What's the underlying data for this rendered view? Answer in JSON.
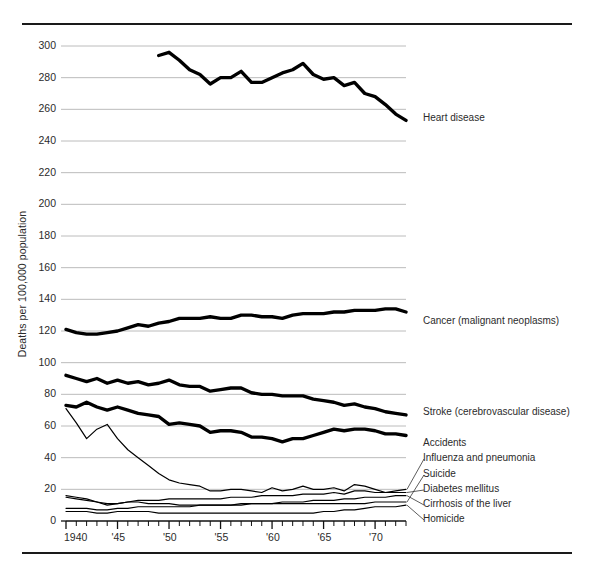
{
  "chart_data": {
    "type": "line",
    "title": "",
    "xlabel": "",
    "ylabel": "Deaths per 100,000 population",
    "xlim": [
      1940,
      1973
    ],
    "ylim": [
      0,
      300
    ],
    "grid": true,
    "legend_position": "right-inline",
    "y_ticks": [
      0,
      20,
      40,
      60,
      80,
      100,
      120,
      140,
      160,
      180,
      200,
      220,
      240,
      260,
      280,
      300
    ],
    "y_tick_labels": [
      "0",
      "20",
      "40",
      "60",
      "80",
      "100",
      "120",
      "140",
      "160",
      "180",
      "200",
      "220",
      "240",
      "260",
      "280",
      "300"
    ],
    "x_ticks": [
      1940,
      1945,
      1950,
      1955,
      1960,
      1965,
      1970
    ],
    "x_tick_labels": [
      "1940",
      "'45",
      "'50",
      "'55",
      "'60",
      "'65",
      "'70"
    ],
    "x_minor_step": 1,
    "series": [
      {
        "name": "Heart disease",
        "label": "Heart disease",
        "emphasis": "heavy",
        "x": [
          1949,
          1950,
          1951,
          1952,
          1953,
          1954,
          1955,
          1956,
          1957,
          1958,
          1959,
          1960,
          1961,
          1962,
          1963,
          1964,
          1965,
          1966,
          1967,
          1968,
          1969,
          1970,
          1971,
          1972,
          1973
        ],
        "values": [
          294,
          296,
          291,
          285,
          282,
          276,
          280,
          280,
          284,
          277,
          277,
          280,
          283,
          285,
          289,
          282,
          279,
          280,
          275,
          277,
          270,
          268,
          263,
          257,
          253
        ]
      },
      {
        "name": "Cancer (malignant neoplasms)",
        "label": "Cancer (malignant neoplasms)",
        "emphasis": "heavy",
        "x": [
          1940,
          1941,
          1942,
          1943,
          1944,
          1945,
          1946,
          1947,
          1948,
          1949,
          1950,
          1951,
          1952,
          1953,
          1954,
          1955,
          1956,
          1957,
          1958,
          1959,
          1960,
          1961,
          1962,
          1963,
          1964,
          1965,
          1966,
          1967,
          1968,
          1969,
          1970,
          1971,
          1972,
          1973
        ],
        "values": [
          121,
          119,
          118,
          118,
          119,
          120,
          122,
          124,
          123,
          125,
          126,
          128,
          128,
          128,
          129,
          128,
          128,
          130,
          130,
          129,
          129,
          128,
          130,
          131,
          131,
          131,
          132,
          132,
          133,
          133,
          133,
          134,
          134,
          132
        ]
      },
      {
        "name": "Stroke (cerebrovascular disease)",
        "label": "Stroke (cerebrovascular disease)",
        "emphasis": "heavy",
        "x": [
          1940,
          1941,
          1942,
          1943,
          1944,
          1945,
          1946,
          1947,
          1948,
          1949,
          1950,
          1951,
          1952,
          1953,
          1954,
          1955,
          1956,
          1957,
          1958,
          1959,
          1960,
          1961,
          1962,
          1963,
          1964,
          1965,
          1966,
          1967,
          1968,
          1969,
          1970,
          1971,
          1972,
          1973
        ],
        "values": [
          92,
          90,
          88,
          90,
          87,
          89,
          87,
          88,
          86,
          87,
          89,
          86,
          85,
          85,
          82,
          83,
          84,
          84,
          81,
          80,
          80,
          79,
          79,
          79,
          77,
          76,
          75,
          73,
          74,
          72,
          71,
          69,
          68,
          67
        ]
      },
      {
        "name": "Accidents",
        "label": "Accidents",
        "emphasis": "heavy",
        "x": [
          1940,
          1941,
          1942,
          1943,
          1944,
          1945,
          1946,
          1947,
          1948,
          1949,
          1950,
          1951,
          1952,
          1953,
          1954,
          1955,
          1956,
          1957,
          1958,
          1959,
          1960,
          1961,
          1962,
          1963,
          1964,
          1965,
          1966,
          1967,
          1968,
          1969,
          1970,
          1971,
          1972,
          1973
        ],
        "values": [
          73,
          72,
          75,
          72,
          70,
          72,
          70,
          68,
          67,
          66,
          61,
          62,
          61,
          60,
          56,
          57,
          57,
          56,
          53,
          53,
          52,
          50,
          52,
          52,
          54,
          56,
          58,
          57,
          58,
          58,
          57,
          55,
          55,
          54
        ]
      },
      {
        "name": "Influenza and pneumonia",
        "label": "Influenza and pneumonia",
        "emphasis": "light",
        "x": [
          1940,
          1941,
          1942,
          1943,
          1944,
          1945,
          1946,
          1947,
          1948,
          1949,
          1950,
          1951,
          1952,
          1953,
          1954,
          1955,
          1956,
          1957,
          1958,
          1959,
          1960,
          1961,
          1962,
          1963,
          1964,
          1965,
          1966,
          1967,
          1968,
          1969,
          1970,
          1971,
          1972,
          1973
        ],
        "values": [
          71,
          62,
          52,
          58,
          61,
          52,
          45,
          40,
          35,
          30,
          26,
          24,
          23,
          22,
          19,
          19,
          20,
          20,
          19,
          18,
          21,
          19,
          20,
          22,
          20,
          20,
          21,
          19,
          23,
          22,
          20,
          18,
          19,
          20
        ]
      },
      {
        "name": "Suicide",
        "label": "Suicide",
        "emphasis": "light",
        "x": [
          1940,
          1941,
          1942,
          1943,
          1944,
          1945,
          1946,
          1947,
          1948,
          1949,
          1950,
          1951,
          1952,
          1953,
          1954,
          1955,
          1956,
          1957,
          1958,
          1959,
          1960,
          1961,
          1962,
          1963,
          1964,
          1965,
          1966,
          1967,
          1968,
          1969,
          1970,
          1971,
          1972,
          1973
        ],
        "values": [
          16,
          15,
          14,
          12,
          10,
          11,
          12,
          12,
          11,
          11,
          11,
          10,
          10,
          10,
          10,
          10,
          10,
          10,
          11,
          11,
          11,
          11,
          11,
          11,
          11,
          11,
          11,
          11,
          11,
          11,
          12,
          12,
          12,
          12
        ]
      },
      {
        "name": "Diabetes mellitus",
        "label": "Diabetes mellitus",
        "emphasis": "light",
        "x": [
          1940,
          1941,
          1942,
          1943,
          1944,
          1945,
          1946,
          1947,
          1948,
          1949,
          1950,
          1951,
          1952,
          1953,
          1954,
          1955,
          1956,
          1957,
          1958,
          1959,
          1960,
          1961,
          1962,
          1963,
          1964,
          1965,
          1966,
          1967,
          1968,
          1969,
          1970,
          1971,
          1972,
          1973
        ],
        "values": [
          15,
          14,
          13,
          12,
          11,
          11,
          12,
          13,
          13,
          13,
          14,
          14,
          14,
          14,
          14,
          14,
          15,
          15,
          15,
          16,
          16,
          16,
          16,
          17,
          17,
          17,
          18,
          17,
          19,
          19,
          18,
          18,
          18,
          18
        ]
      },
      {
        "name": "Cirrhosis of the liver",
        "label": "Cirrhosis of the liver",
        "emphasis": "light",
        "x": [
          1940,
          1941,
          1942,
          1943,
          1944,
          1945,
          1946,
          1947,
          1948,
          1949,
          1950,
          1951,
          1952,
          1953,
          1954,
          1955,
          1956,
          1957,
          1958,
          1959,
          1960,
          1961,
          1962,
          1963,
          1964,
          1965,
          1966,
          1967,
          1968,
          1969,
          1970,
          1971,
          1972,
          1973
        ],
        "values": [
          8,
          8,
          8,
          7,
          7,
          8,
          8,
          9,
          9,
          9,
          9,
          9,
          9,
          10,
          10,
          10,
          10,
          11,
          11,
          11,
          11,
          12,
          12,
          12,
          13,
          13,
          13,
          14,
          14,
          15,
          15,
          15,
          16,
          16
        ]
      },
      {
        "name": "Homicide",
        "label": "Homicide",
        "emphasis": "light",
        "x": [
          1940,
          1941,
          1942,
          1943,
          1944,
          1945,
          1946,
          1947,
          1948,
          1949,
          1950,
          1951,
          1952,
          1953,
          1954,
          1955,
          1956,
          1957,
          1958,
          1959,
          1960,
          1961,
          1962,
          1963,
          1964,
          1965,
          1966,
          1967,
          1968,
          1969,
          1970,
          1971,
          1972,
          1973
        ],
        "values": [
          6,
          6,
          6,
          5,
          5,
          6,
          6,
          6,
          6,
          5,
          5,
          5,
          5,
          5,
          5,
          5,
          5,
          5,
          5,
          5,
          5,
          5,
          5,
          5,
          5,
          6,
          6,
          7,
          7,
          8,
          9,
          9,
          9,
          10
        ]
      }
    ]
  },
  "labels": {
    "heart_disease": "Heart disease",
    "cancer": "Cancer (malignant neoplasms)",
    "stroke": "Stroke (cerebrovascular disease)",
    "accidents": "Accidents",
    "influenza": "Influenza and pneumonia",
    "suicide": "Suicide",
    "diabetes": "Diabetes mellitus",
    "cirrhosis": "Cirrhosis of the liver",
    "homicide": "Homicide"
  },
  "colors": {
    "line": "#000000",
    "grid": "#b4b4b4",
    "text": "#2b2b2b",
    "rule": "#1a1a1a",
    "background": "#ffffff"
  }
}
